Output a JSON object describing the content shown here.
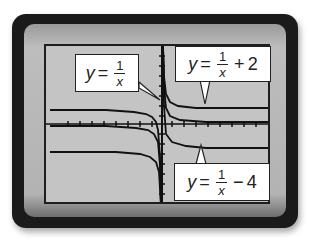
{
  "figure": {
    "colors": {
      "bezel": "#1a1a1a",
      "screen": "#c4c4c4",
      "curve": "#111111",
      "callout_bg": "#ffffff"
    }
  },
  "labels": {
    "base": {
      "lhs": "y",
      "eq": "=",
      "num": "1",
      "den": "x",
      "tail": ""
    },
    "up": {
      "lhs": "y",
      "eq": "=",
      "num": "1",
      "den": "x",
      "op": "+",
      "const": "2"
    },
    "down": {
      "lhs": "y",
      "eq": "=",
      "num": "1",
      "den": "x",
      "op": "−",
      "const": "4"
    }
  },
  "curves": [
    {
      "name": "y = 1/x",
      "shift": 0
    },
    {
      "name": "y = 1/x + 2",
      "shift": 2
    },
    {
      "name": "y = 1/x - 4",
      "shift": -4
    }
  ]
}
